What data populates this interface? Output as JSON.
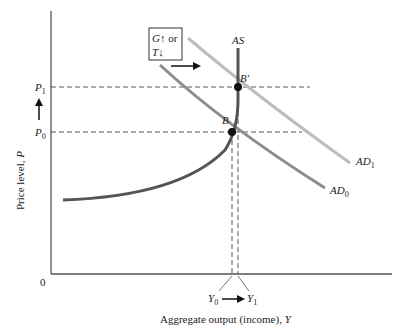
{
  "diagram": {
    "type": "AD-AS shift",
    "x_axis": {
      "label": "Aggregate output (income), ",
      "label_var": "Y",
      "origin": "0"
    },
    "y_axis": {
      "label": "Price level, ",
      "label_var": "P"
    },
    "price_labels": {
      "p1": "P",
      "p1_sub": "1",
      "p0": "P",
      "p0_sub": "0"
    },
    "output_labels": {
      "y0": "Y",
      "y0_sub": "0",
      "y1": "Y",
      "y1_sub": "1"
    },
    "policy_box": {
      "line1_var": "G",
      "line1_arrow": "↑",
      "line1_text": " or",
      "line2_var": "T",
      "line2_arrow": "↓"
    },
    "curves": {
      "as": {
        "label": "AS",
        "color": "#555555"
      },
      "ad0": {
        "label": "AD",
        "sub": "0",
        "color": "#8a8a8a"
      },
      "ad1": {
        "label": "AD",
        "sub": "1",
        "color": "#b8b8b8"
      }
    },
    "points": {
      "b": "B",
      "b_prime": "B′"
    }
  }
}
